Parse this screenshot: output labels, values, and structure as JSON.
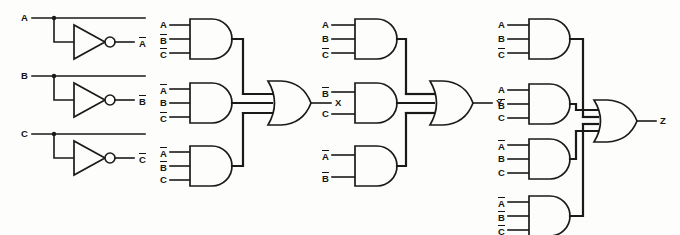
{
  "diagram": {
    "background_color": "#fdfdfc",
    "line_color": "#1a1a1a"
  },
  "inverter_section": {
    "label": "input inverters",
    "rows": [
      {
        "input_label": "A",
        "output_label": "A",
        "output_overbar": true
      },
      {
        "input_label": "B",
        "output_label": "B",
        "output_overbar": true
      },
      {
        "input_label": "C",
        "output_label": "C",
        "output_overbar": true
      }
    ]
  },
  "blocks": [
    {
      "id": "x",
      "output_label": "X",
      "gate_type": "OR",
      "and_gates": [
        {
          "inputs": [
            {
              "text": "A",
              "overbar": false
            },
            {
              "text": "B",
              "overbar": true
            },
            {
              "text": "C",
              "overbar": true
            }
          ]
        },
        {
          "inputs": [
            {
              "text": "A",
              "overbar": true
            },
            {
              "text": "B",
              "overbar": false
            },
            {
              "text": "C",
              "overbar": true
            }
          ]
        },
        {
          "inputs": [
            {
              "text": "A",
              "overbar": true
            },
            {
              "text": "B",
              "overbar": true
            },
            {
              "text": "C",
              "overbar": false
            }
          ]
        }
      ]
    },
    {
      "id": "y",
      "output_label": "Y",
      "gate_type": "OR",
      "and_gates": [
        {
          "inputs": [
            {
              "text": "A",
              "overbar": false
            },
            {
              "text": "B",
              "overbar": false
            },
            {
              "text": "C",
              "overbar": true
            }
          ]
        },
        {
          "inputs": [
            {
              "text": "B",
              "overbar": true
            },
            {
              "text": "C",
              "overbar": false
            }
          ]
        },
        {
          "inputs": [
            {
              "text": "A",
              "overbar": true
            },
            {
              "text": "B",
              "overbar": true
            }
          ]
        }
      ]
    },
    {
      "id": "z",
      "output_label": "Z",
      "gate_type": "OR",
      "and_gates": [
        {
          "inputs": [
            {
              "text": "A",
              "overbar": false
            },
            {
              "text": "B",
              "overbar": false
            },
            {
              "text": "C",
              "overbar": true
            }
          ]
        },
        {
          "inputs": [
            {
              "text": "A",
              "overbar": false
            },
            {
              "text": "B",
              "overbar": true
            },
            {
              "text": "C",
              "overbar": false
            }
          ]
        },
        {
          "inputs": [
            {
              "text": "A",
              "overbar": true
            },
            {
              "text": "B",
              "overbar": false
            },
            {
              "text": "C",
              "overbar": false
            }
          ]
        },
        {
          "inputs": [
            {
              "text": "A",
              "overbar": true
            },
            {
              "text": "B",
              "overbar": true
            },
            {
              "text": "C",
              "overbar": true
            }
          ]
        }
      ]
    }
  ]
}
